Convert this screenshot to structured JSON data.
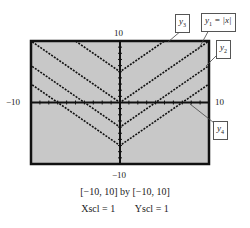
{
  "window": {
    "xmin": "-10",
    "xmax": "10",
    "ymin": "-10",
    "ymax": "10"
  },
  "captions": {
    "range": "[−10, 10]  by  [−10, 10]",
    "scale": "Xscl = 1        Yscl = 1"
  },
  "axis_labels": {
    "top": "10",
    "bottom": "−10",
    "left": "−10",
    "right": "10"
  },
  "legend": {
    "y1": "y",
    "y1_sub": "1",
    "y1_eq": " = |x|",
    "y2": "y",
    "y2_sub": "2",
    "y3": "y",
    "y3_sub": "3",
    "y4": "y",
    "y4_sub": "4"
  },
  "chart_data": {
    "type": "line",
    "title": "",
    "xlim": [
      -10,
      10
    ],
    "ylim": [
      -10,
      10
    ],
    "xscl": 1,
    "yscl": 1,
    "grid": false,
    "series": [
      {
        "name": "y1 = |x|",
        "shift": 0
      },
      {
        "name": "y2",
        "shift": -4
      },
      {
        "name": "y3",
        "shift": 5
      },
      {
        "name": "y4",
        "shift": -7
      }
    ]
  }
}
